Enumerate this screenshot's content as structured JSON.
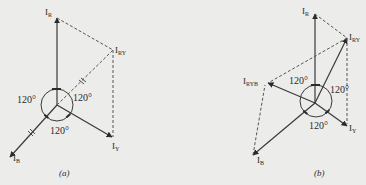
{
  "diagram_a": {
    "caption": "(a)",
    "phasors": {
      "IR": {
        "main": "I",
        "sub": "R"
      },
      "IY": {
        "main": "I",
        "sub": "Y"
      },
      "IB": {
        "main": "I",
        "sub": "B"
      },
      "IRY": {
        "main": "I",
        "sub": "RY"
      }
    },
    "angles": [
      "120°",
      "120°",
      "120°"
    ]
  },
  "diagram_b": {
    "caption": "(b)",
    "phasors": {
      "IR": {
        "main": "I",
        "sub": "R"
      },
      "IY": {
        "main": "I",
        "sub": "Y"
      },
      "IB": {
        "main": "I",
        "sub": "B"
      },
      "IRY": {
        "main": "I",
        "sub": "RY"
      },
      "IRYB": {
        "main": "I",
        "sub": "RYB"
      }
    },
    "angles": [
      "120°",
      "120°",
      "120°"
    ]
  },
  "colors": {
    "line": "#3a3a3a",
    "dashed": "#555555",
    "background": "#ececea"
  }
}
